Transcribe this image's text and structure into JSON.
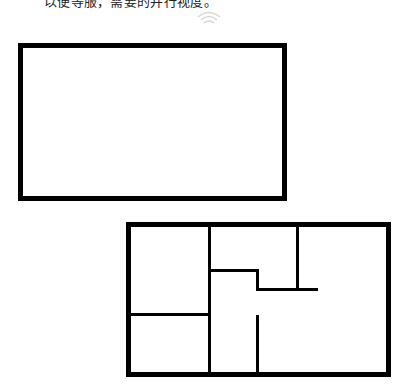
{
  "caption": {
    "text": "以便等服，需要的并行视度。"
  },
  "icons": {
    "top_icon": "wifi-icon"
  },
  "shapes": {
    "rectangle": {
      "label": "empty-rectangle"
    },
    "floor_plan": {
      "label": "floor-plan",
      "rooms": 5
    }
  },
  "colors": {
    "stroke": "#000000",
    "background": "#ffffff",
    "icon": "#d8d8d8"
  }
}
